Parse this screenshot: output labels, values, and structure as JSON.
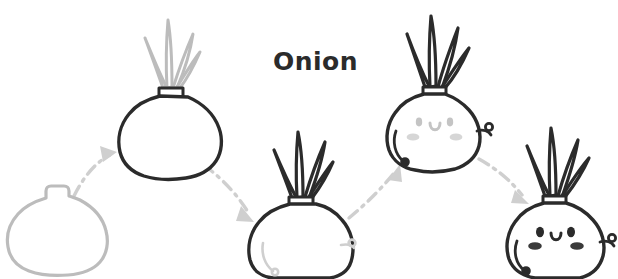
{
  "illustration": {
    "title": "Onion",
    "subject": "onion-growth-stages",
    "background_color": "#ffffff",
    "ink_color": "#2b2b2b",
    "faded_color": "#bcbcbc",
    "mid_color": "#cfcfcf",
    "blush_color": "#d0d0d0",
    "stage_count": 5,
    "arrow_count": 4,
    "arrow_style": "dash-dot curved arrow",
    "arrow_color": "#cfcfcf"
  },
  "title": {
    "label": "Onion",
    "x": 273,
    "y": 65,
    "color": "#2b2b2b"
  },
  "stages": [
    {
      "index": 1,
      "name": "bare-bulb",
      "label": "bulb only",
      "bulb_color": "#bcbcbc",
      "sprout_color": "none",
      "has_sprouts": false,
      "has_face": false,
      "has_arms": false,
      "cx": 60,
      "cy": 225
    },
    {
      "index": 2,
      "name": "bulb-with-faint-sprouts",
      "label": "sprouting",
      "bulb_color": "#2b2b2b",
      "sprout_color": "#bcbcbc",
      "has_sprouts": true,
      "has_face": false,
      "has_arms": false,
      "cx": 170,
      "cy": 130
    },
    {
      "index": 3,
      "name": "bulb-with-dark-sprouts",
      "label": "grown sprouts",
      "bulb_color": "#2b2b2b",
      "sprout_color": "#2b2b2b",
      "has_sprouts": true,
      "has_face": false,
      "has_arms": true,
      "arm_color": "#cfcfcf",
      "cx": 305,
      "cy": 235
    },
    {
      "index": 4,
      "name": "onion-character-faint-face",
      "label": "face appearing",
      "bulb_color": "#2b2b2b",
      "sprout_color": "#2b2b2b",
      "has_sprouts": true,
      "has_face": true,
      "face_color": "#c4c4c4",
      "has_arms": true,
      "arm_color": "#2b2b2b",
      "cx": 437,
      "cy": 125
    },
    {
      "index": 5,
      "name": "onion-character-full-face",
      "label": "full character",
      "bulb_color": "#2b2b2b",
      "sprout_color": "#2b2b2b",
      "has_sprouts": true,
      "has_face": true,
      "face_color": "#2b2b2b",
      "has_arms": true,
      "arm_color": "#2b2b2b",
      "cx": 557,
      "cy": 233
    }
  ],
  "arrows": [
    {
      "index": 1,
      "from_stage": 1,
      "to_stage": 2,
      "direction": "up-right",
      "path": "M 78 192 C 88 172 100 160 112 154"
    },
    {
      "index": 2,
      "from_stage": 2,
      "to_stage": 3,
      "direction": "down-right",
      "path": "M 205 163 C 225 178 240 196 250 214"
    },
    {
      "index": 3,
      "from_stage": 3,
      "to_stage": 4,
      "direction": "up-right",
      "path": "M 348 215 C 366 202 382 186 396 170"
    },
    {
      "index": 4,
      "from_stage": 4,
      "to_stage": 5,
      "direction": "down-right",
      "path": "M 480 158 C 498 168 512 180 524 194"
    }
  ]
}
